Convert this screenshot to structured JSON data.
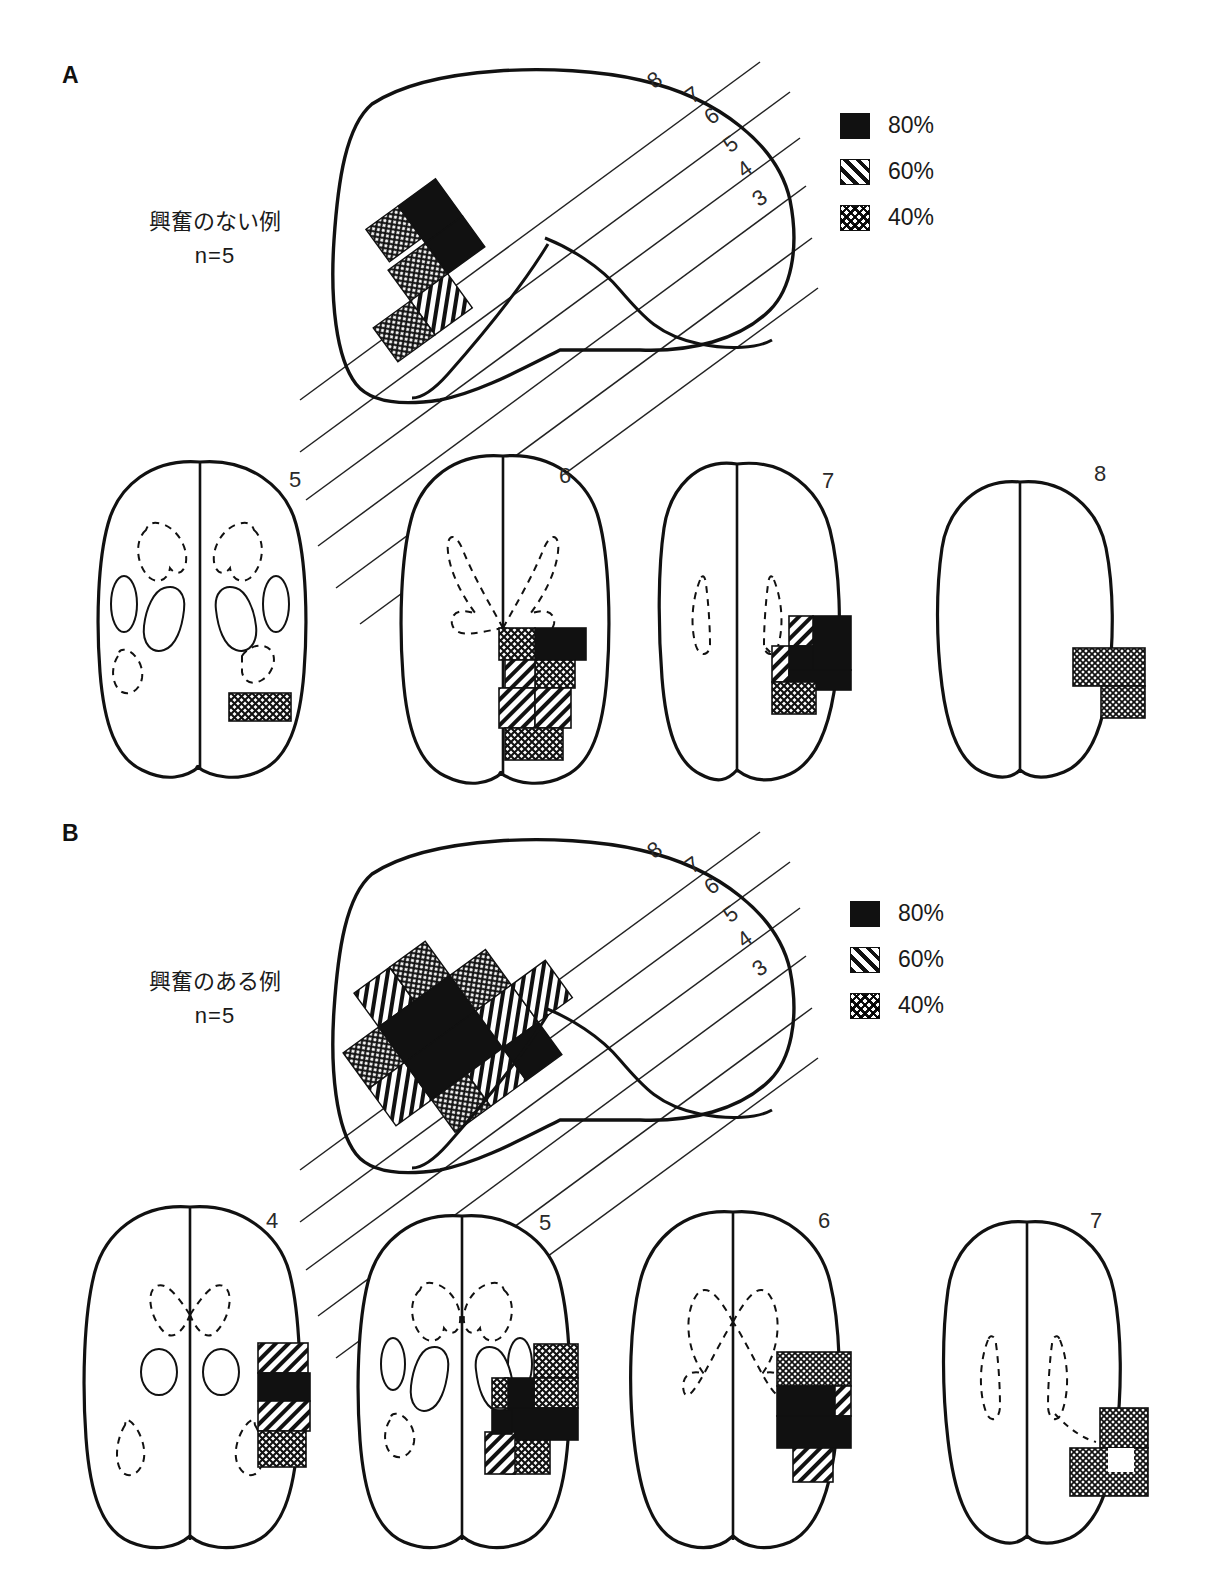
{
  "figure": {
    "type": "lesion-overlap-brain-diagram",
    "background": "#ffffff",
    "ink": "#111111"
  },
  "panels": [
    {
      "id": "A",
      "label": "A",
      "caption_line1": "興奮のない例",
      "caption_line2": "n=5",
      "legend": {
        "items": [
          {
            "pattern": "solid-black",
            "label": "80%"
          },
          {
            "pattern": "diagonal-hatch",
            "label": "60%"
          },
          {
            "pattern": "crosshatch",
            "label": "40%"
          }
        ]
      },
      "lateral_view": {
        "slice_line_labels": [
          "8",
          "7",
          "6",
          "5",
          "4",
          "3"
        ],
        "lesion_blocks": [
          {
            "pattern": "crosshatch",
            "label": "40%"
          },
          {
            "pattern": "solid-black",
            "label": "80%"
          },
          {
            "pattern": "crosshatch",
            "label": "40%"
          },
          {
            "pattern": "diagonal-hatch",
            "label": "60%"
          },
          {
            "pattern": "crosshatch",
            "label": "40%"
          }
        ]
      },
      "axial_slices": [
        {
          "number": "5",
          "ventricles": "full-basal-ganglia",
          "lesion_patterns": [
            "crosshatch"
          ]
        },
        {
          "number": "6",
          "ventricles": "x-shaped-dashed",
          "lesion_patterns": [
            "solid-black",
            "crosshatch",
            "diagonal-hatch",
            "crosshatch"
          ]
        },
        {
          "number": "7",
          "ventricles": "slim-dashed",
          "lesion_patterns": [
            "solid-black",
            "diagonal-hatch",
            "crosshatch"
          ]
        },
        {
          "number": "8",
          "ventricles": "none",
          "lesion_patterns": [
            "crosshatch"
          ]
        }
      ]
    },
    {
      "id": "B",
      "label": "B",
      "caption_line1": "興奮のある例",
      "caption_line2": "n=5",
      "legend": {
        "items": [
          {
            "pattern": "solid-black",
            "label": "80%"
          },
          {
            "pattern": "diagonal-hatch",
            "label": "60%"
          },
          {
            "pattern": "crosshatch",
            "label": "40%"
          }
        ]
      },
      "lateral_view": {
        "slice_line_labels": [
          "8",
          "7",
          "6",
          "5",
          "4",
          "3"
        ],
        "lesion_blocks": [
          {
            "pattern": "crosshatch",
            "label": "40%"
          },
          {
            "pattern": "diagonal-hatch",
            "label": "60%"
          },
          {
            "pattern": "solid-black",
            "label": "80%"
          },
          {
            "pattern": "diagonal-hatch",
            "label": "60%"
          },
          {
            "pattern": "crosshatch",
            "label": "40%"
          }
        ]
      },
      "axial_slices": [
        {
          "number": "4",
          "ventricles": "full-basal-ganglia",
          "lesion_patterns": [
            "diagonal-hatch",
            "solid-black",
            "diagonal-hatch",
            "crosshatch"
          ]
        },
        {
          "number": "5",
          "ventricles": "full-basal-ganglia",
          "lesion_patterns": [
            "crosshatch",
            "solid-black",
            "diagonal-hatch"
          ]
        },
        {
          "number": "6",
          "ventricles": "x-shaped-dashed",
          "lesion_patterns": [
            "crosshatch",
            "solid-black",
            "diagonal-hatch"
          ]
        },
        {
          "number": "7",
          "ventricles": "slim-dashed",
          "lesion_patterns": [
            "crosshatch"
          ]
        }
      ]
    }
  ]
}
